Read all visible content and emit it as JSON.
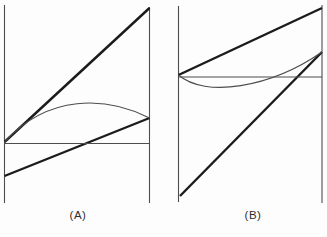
{
  "figure": {
    "background_color": "#fdfdfd",
    "thick_stroke_color": "#1b1b1b",
    "thin_stroke_color": "#4d4d4d",
    "thick_stroke_width": 2.4,
    "thin_stroke_width": 1.1,
    "canvas": {
      "width": 327,
      "height": 237
    },
    "panels": [
      {
        "id": "A",
        "label": "(A)",
        "shapes": [
          {
            "name": "panel-a-left-vertical-line",
            "kind": "line",
            "x1": 4.5,
            "y1": 5,
            "x2": 4.5,
            "y2": 203,
            "weight": "thin"
          },
          {
            "name": "panel-a-right-vertical-line",
            "kind": "line",
            "x1": 149.5,
            "y1": 7,
            "x2": 149.5,
            "y2": 203,
            "weight": "thin"
          },
          {
            "name": "panel-a-upper-diagonal-line",
            "kind": "line",
            "x1": 4.5,
            "y1": 142,
            "x2": 149.5,
            "y2": 8,
            "weight": "thick"
          },
          {
            "name": "panel-a-lower-diagonal-line",
            "kind": "line",
            "x1": 4.5,
            "y1": 176,
            "x2": 149.5,
            "y2": 118,
            "weight": "thick"
          },
          {
            "name": "panel-a-horizontal-tie-line",
            "kind": "line",
            "x1": 4.5,
            "y1": 143.5,
            "x2": 149.5,
            "y2": 143.5,
            "weight": "thin"
          },
          {
            "name": "panel-a-upper-bulge-curve",
            "kind": "path",
            "d": "M 4.5 142 C 48 94 106 96 149.5 118",
            "weight": "thin"
          }
        ]
      },
      {
        "id": "B",
        "label": "(B)",
        "shapes": [
          {
            "name": "panel-b-left-vertical-line",
            "kind": "line",
            "x1": 178.5,
            "y1": 6,
            "x2": 178.5,
            "y2": 202,
            "weight": "thin"
          },
          {
            "name": "panel-b-right-vertical-line",
            "kind": "line",
            "x1": 322,
            "y1": 5,
            "x2": 322,
            "y2": 203,
            "weight": "thin"
          },
          {
            "name": "panel-b-upper-diagonal-line",
            "kind": "line",
            "x1": 178.5,
            "y1": 75,
            "x2": 322,
            "y2": 8,
            "weight": "thick"
          },
          {
            "name": "panel-b-lower-diagonal-line",
            "kind": "line",
            "x1": 180,
            "y1": 196,
            "x2": 322,
            "y2": 52,
            "weight": "thick"
          },
          {
            "name": "panel-b-horizontal-tie-line",
            "kind": "line",
            "x1": 178.5,
            "y1": 77,
            "x2": 322,
            "y2": 77,
            "weight": "thin"
          },
          {
            "name": "panel-b-lower-dip-curve",
            "kind": "path",
            "d": "M 178.5 75 C 205 98 270 88 322 52",
            "weight": "thin"
          }
        ]
      }
    ]
  }
}
